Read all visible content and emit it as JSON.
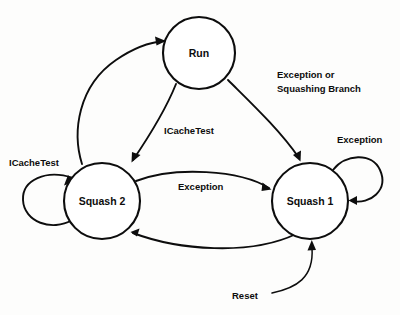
{
  "diagram": {
    "type": "state-transition-diagram",
    "background_color": "#fdfdfc",
    "line_color": "#0d0d0d",
    "states": [
      {
        "id": "run",
        "label": "Run",
        "cx": 199,
        "cy": 53,
        "r": 36
      },
      {
        "id": "squash2",
        "label": "Squash 2",
        "cx": 102,
        "cy": 201,
        "r": 38
      },
      {
        "id": "squash1",
        "label": "Squash 1",
        "cx": 310,
        "cy": 201,
        "r": 38
      }
    ],
    "transitions": [
      {
        "id": "squash2-to-run",
        "from": "squash2",
        "to": "run",
        "label": "",
        "label_x": 0,
        "label_y": 0
      },
      {
        "id": "run-to-squash2",
        "from": "run",
        "to": "squash2",
        "label": "ICacheTest",
        "label_x": 164,
        "label_y": 134
      },
      {
        "id": "run-to-squash1",
        "from": "run",
        "to": "squash1",
        "label": "Exception or",
        "label2": "Squashing Branch",
        "label_x": 277,
        "label_y": 78,
        "label2_x": 277,
        "label2_y": 92
      },
      {
        "id": "squash2-to-squash1",
        "from": "squash2",
        "to": "squash1",
        "label": "Exception",
        "label_x": 178,
        "label_y": 190
      },
      {
        "id": "squash1-to-squash2",
        "from": "squash1",
        "to": "squash2",
        "label": "",
        "label_x": 0,
        "label_y": 0
      },
      {
        "id": "squash2-self-loop",
        "from": "squash2",
        "to": "squash2",
        "label": "ICacheTest",
        "label_x": 9,
        "label_y": 166
      },
      {
        "id": "squash1-self-loop",
        "from": "squash1",
        "to": "squash1",
        "label": "Exception",
        "label_x": 337,
        "label_y": 143
      },
      {
        "id": "reset-entry",
        "from": "",
        "to": "squash1",
        "label": "Reset",
        "label_x": 232,
        "label_y": 299
      }
    ]
  }
}
